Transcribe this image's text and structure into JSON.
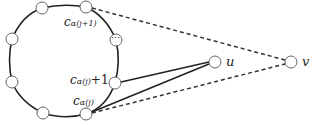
{
  "diagram": {
    "type": "graph",
    "cycle": {
      "center": [
        64,
        61
      ],
      "nodes": [
        {
          "id": "n_top_left",
          "pos": [
            42,
            8
          ],
          "label": ""
        },
        {
          "id": "c_alpha_j_plus_1",
          "pos": [
            86,
            7
          ],
          "label": "c",
          "subscript": "α(j+1)"
        },
        {
          "id": "ellipsis",
          "pos": [
            116,
            40
          ],
          "label": "⋯"
        },
        {
          "id": "c_alpha_j_plus1_node",
          "pos": [
            115,
            83
          ],
          "label": "c",
          "subscript": "α(j)",
          "suffix": "+1"
        },
        {
          "id": "c_alpha_j",
          "pos": [
            86,
            114
          ],
          "label": "c",
          "subscript": "α(j)"
        },
        {
          "id": "n_bottom_left",
          "pos": [
            43,
            113
          ],
          "label": ""
        },
        {
          "id": "n_left_lower",
          "pos": [
            12,
            82
          ],
          "label": ""
        },
        {
          "id": "n_left_upper",
          "pos": [
            12,
            39
          ],
          "label": ""
        }
      ]
    },
    "external_nodes": [
      {
        "id": "u",
        "pos": [
          215,
          62
        ],
        "label": "u"
      },
      {
        "id": "v",
        "pos": [
          291,
          62
        ],
        "label": "v"
      }
    ],
    "edges": [
      {
        "from": "c_alpha_j_plus1_node",
        "to": "u",
        "style": "solid"
      },
      {
        "from": "c_alpha_j",
        "to": "u",
        "style": "solid"
      },
      {
        "from": "c_alpha_j_plus_1",
        "to": "v",
        "style": "dashed"
      },
      {
        "from": "c_alpha_j",
        "to": "v",
        "style": "dashed"
      }
    ],
    "labels": {
      "top": {
        "base": "c",
        "sub": "α(j+1)"
      },
      "middle": {
        "base": "c",
        "sub": "α(j)",
        "suffix": "+1"
      },
      "bottom": {
        "base": "c",
        "sub": "α(j)"
      },
      "u": "u",
      "v": "v",
      "ellipsis": "⋯"
    },
    "colors": {
      "stroke": "#222222",
      "node_stroke": "#555555",
      "fill": "#ffffff"
    }
  }
}
